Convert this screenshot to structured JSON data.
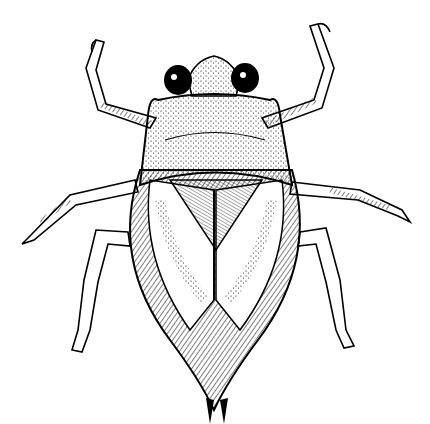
{
  "image": {
    "subject": "water bug illustration",
    "style": "black ink pen drawing on white",
    "colors": {
      "ink": "#000000",
      "paper": "#ffffff"
    }
  }
}
